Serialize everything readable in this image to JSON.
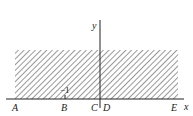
{
  "figure": {
    "axes": {
      "x_label": "x",
      "y_label": "y"
    },
    "points": [
      {
        "label": "A",
        "x": 15
      },
      {
        "label": "B",
        "x": 64
      },
      {
        "label": "C",
        "x": 94
      },
      {
        "label": "D",
        "x": 104
      },
      {
        "label": "E",
        "x": 173
      }
    ],
    "tick_label": "−1",
    "shaded_region": {
      "description": "hatched rectangular region above x-axis",
      "x_from": 15,
      "x_to": 178
    },
    "colors": {
      "ink": "#222222",
      "background": "#ffffff"
    }
  }
}
